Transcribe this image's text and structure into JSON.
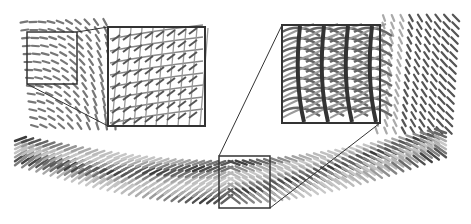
{
  "figure": {
    "background": "#ffffff",
    "frame_color": "#333333",
    "glyph_color_dark": "#2a2a2a",
    "glyph_color_mid": "#7a7a7a",
    "glyph_color_light": "#c8c8c8",
    "regions": {
      "left_source_box": {
        "x": 27,
        "y": 32,
        "w": 50,
        "h": 52
      },
      "left_inset": {
        "x": 108,
        "y": 27,
        "w": 97,
        "h": 99,
        "content": "sparse grid of rod glyphs with connecting lines"
      },
      "bottom_source_box": {
        "x": 219,
        "y": 156,
        "w": 51,
        "h": 52
      },
      "right_inset": {
        "x": 282,
        "y": 25,
        "w": 98,
        "h": 98,
        "content": "dense interwoven tubular glyphs"
      }
    },
    "band": {
      "label": "helical ribbon of oriented glyphs",
      "count": 60
    }
  }
}
